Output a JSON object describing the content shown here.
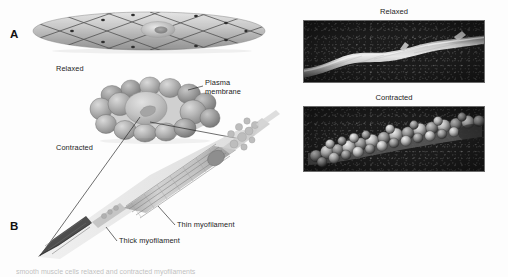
{
  "figure": {
    "panels": {
      "a_letter": "A",
      "b_letter": "B"
    },
    "diagram_labels": {
      "relaxed_cell": "Relaxed",
      "contracted_cell": "Contracted",
      "plasma_membrane": "Plasma\nmembrane",
      "plasma_membrane_line1": "Plasma",
      "plasma_membrane_line2": "membrane",
      "thin_myofilament": "Thin myofilament",
      "thick_myofilament": "Thick myofilament"
    },
    "micrographs": [
      {
        "title": "Relaxed",
        "name": "relaxed-micrograph"
      },
      {
        "title": "Contracted",
        "name": "contracted-micrograph"
      }
    ],
    "caption": "smooth muscle cells relaxed and contracted myofilaments",
    "colors": {
      "cell_fill_light": "#d9d9d9",
      "cell_fill_mid": "#b5b5b5",
      "cell_fill_dark": "#8f8f8f",
      "nucleus": "#cfcfcf",
      "lattice_line": "#4a4a4a",
      "leader_line": "#1f1f1f",
      "photo_background": "#111111",
      "page_background": "#ffffff",
      "text": "#232323"
    }
  }
}
